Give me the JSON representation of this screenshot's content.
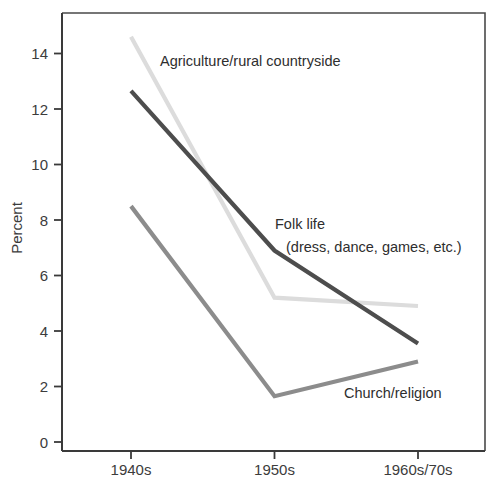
{
  "chart_data": {
    "type": "line",
    "title": "",
    "subtitle": "",
    "xlabel": "",
    "ylabel": "Percent",
    "categories": [
      "1940s",
      "1950s",
      "1960s/70s"
    ],
    "xlim": [
      0,
      2
    ],
    "ylim": [
      0,
      15
    ],
    "yticks": [
      0,
      2,
      4,
      6,
      8,
      10,
      12,
      14
    ],
    "ytick_labels": [
      "0",
      "2",
      "4",
      "6",
      "8",
      "10",
      "12",
      "14"
    ],
    "grid": false,
    "legend": "inline-annotations",
    "series": [
      {
        "name": "Agriculture/rural countryside",
        "color": "#dcdcdc",
        "values": [
          14.6,
          5.2,
          4.9
        ]
      },
      {
        "name": "Folk life (dress, dance, games, etc.)",
        "color": "#4d4d4d",
        "values": [
          12.65,
          6.9,
          3.55
        ]
      },
      {
        "name": "Church/religion",
        "color": "#8c8c8c",
        "values": [
          8.5,
          1.65,
          2.9
        ]
      }
    ],
    "annotations": [
      {
        "id": "agriculture",
        "text": "Agriculture/rural countryside",
        "x": 160,
        "y": 66
      },
      {
        "id": "folklife-line1",
        "text": "Folk life",
        "x": 275,
        "y": 229
      },
      {
        "id": "folklife-line2",
        "text": "(dress, dance, games, etc.)",
        "x": 286,
        "y": 252
      },
      {
        "id": "church",
        "text": "Church/religion",
        "x": 344,
        "y": 398
      }
    ],
    "axis_colors": {
      "axis": "#3a3a3a",
      "frame": "#4a4a4a",
      "text": "#3c3c3c",
      "background": "#ffffff"
    }
  }
}
